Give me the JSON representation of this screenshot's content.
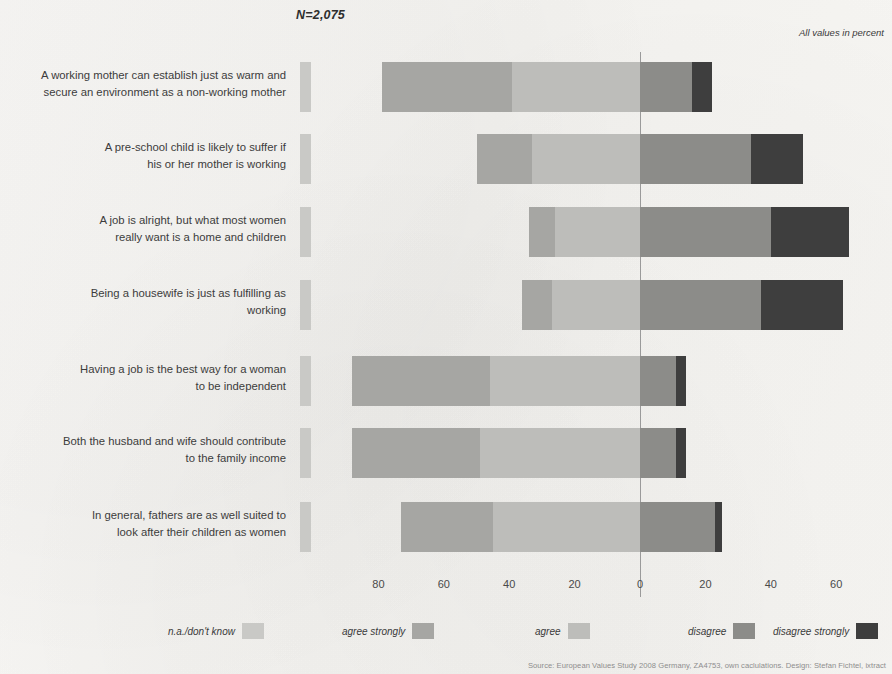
{
  "header": {
    "n_label": "N=2,075",
    "units_note": "All values in percent"
  },
  "source_note": "Source: European Values Study 2008 Germany, ZA4753, own caclulations. Design: Stefan Fichtel, ixtract",
  "axis": {
    "ticks": [
      "80",
      "60",
      "40",
      "20",
      "0",
      "20",
      "40",
      "60"
    ],
    "tick_values": [
      -80,
      -60,
      -40,
      -20,
      0,
      20,
      40,
      60
    ]
  },
  "colors": {
    "na": "#c9c9c6",
    "agree_strongly": "#a6a6a3",
    "agree": "#bdbdba",
    "disagree": "#8c8c89",
    "disagree_strongly": "#3e3e3e",
    "zero_line": "#9a9a9a",
    "background": "#f6f5f3",
    "text": "#3a3a3a"
  },
  "legend": [
    {
      "label": "n.a./don't know",
      "color_key": "na"
    },
    {
      "label": "agree strongly",
      "color_key": "agree_strongly"
    },
    {
      "label": "agree",
      "color_key": "agree"
    },
    {
      "label": "disagree",
      "color_key": "disagree"
    },
    {
      "label": "disagree strongly",
      "color_key": "disagree_strongly"
    }
  ],
  "chart_data": {
    "type": "bar",
    "title": "",
    "subtitle": "",
    "xlabel": "",
    "ylabel": "",
    "orientation": "horizontal",
    "stacked": true,
    "diverging": true,
    "xlim": [
      -90,
      70
    ],
    "grid": false,
    "legend_position": "bottom",
    "series_order": [
      "n.a./don't know",
      "agree strongly",
      "agree",
      "disagree",
      "disagree strongly"
    ],
    "categories": [
      "A working mother can establish just as warm and secure an environment as a non-working mother",
      "A pre-school child is likely to suffer if his or her mother is working",
      "A job is alright, but what most women really want is a home and children",
      "Being a housewife is just as fulfilling as working",
      "Having a job is the best way for a woman to be independent",
      "Both the husband and wife should contribute to the family income",
      "In general, fathers are as well suited to look after their children as women"
    ],
    "series": [
      {
        "name": "n.a./don't know",
        "values": [
          3,
          3,
          3,
          3,
          3,
          2,
          3
        ]
      },
      {
        "name": "agree strongly",
        "values": [
          40,
          17,
          8,
          9,
          42,
          39,
          28
        ]
      },
      {
        "name": "agree",
        "values": [
          39,
          33,
          26,
          27,
          46,
          49,
          45
        ]
      },
      {
        "name": "disagree",
        "values": [
          16,
          34,
          40,
          37,
          11,
          11,
          23
        ]
      },
      {
        "name": "disagree strongly",
        "values": [
          6,
          16,
          24,
          25,
          3,
          3,
          2
        ]
      }
    ]
  },
  "rows": [
    {
      "label_line1": "A working mother can establish just as warm and",
      "label_line2": "secure an environment as a non-working mother"
    },
    {
      "label_line1": "A pre-school child is likely to suffer if",
      "label_line2": "his or her mother is working"
    },
    {
      "label_line1": "A job is alright, but what most women",
      "label_line2": "really want is a home and children"
    },
    {
      "label_line1": "Being a housewife is just as fulfilling as",
      "label_line2": "working"
    },
    {
      "label_line1": "Having a job is the best way for a woman",
      "label_line2": "to be independent"
    },
    {
      "label_line1": "Both the husband and wife should contribute",
      "label_line2": "to the family income"
    },
    {
      "label_line1": "In general, fathers are as well suited to",
      "label_line2": "look after their children as women"
    }
  ],
  "layout": {
    "zero_x": 640,
    "px_per_unit": 3.27,
    "row_tops": [
      10,
      82,
      155,
      228,
      304,
      376,
      450
    ],
    "na_block_x": 300,
    "na_block_width": 11
  }
}
